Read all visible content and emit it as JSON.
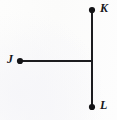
{
  "figure": {
    "type": "geometry-line-diagram",
    "background_color": "#fcfcfb",
    "stroke_color": "#1c1c1f",
    "stroke_width": 2,
    "point_color": "#141417",
    "point_radius": 3.1,
    "canvas": {
      "width": 117,
      "height": 120
    },
    "points": [
      {
        "id": "K",
        "label": "K",
        "x": 92,
        "y": 10,
        "label_x": 103,
        "label_y": 8
      },
      {
        "id": "J",
        "label": "J",
        "x": 20,
        "y": 61,
        "label_x": 10,
        "label_y": 59
      },
      {
        "id": "L",
        "label": "L",
        "x": 92,
        "y": 107,
        "label_x": 103,
        "label_y": 105
      }
    ],
    "junction": {
      "x": 92,
      "y": 61
    },
    "segments": [
      {
        "id": "vertical-KL",
        "from": "K",
        "to": "L",
        "x1": 92,
        "y1": 10,
        "x2": 92,
        "y2": 107
      },
      {
        "id": "horizontal-J",
        "from": "J",
        "to": "junction",
        "x1": 20,
        "y1": 61,
        "x2": 92,
        "y2": 61
      }
    ],
    "labels": {
      "k": "K",
      "j": "J",
      "l": "L"
    }
  }
}
